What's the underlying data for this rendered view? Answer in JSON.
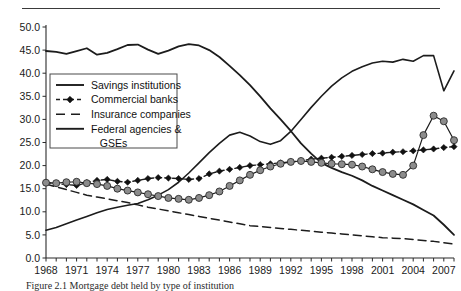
{
  "figure": {
    "caption": "Figure 2.1  Mortgage debt held by type of institution",
    "top_rule": true
  },
  "chart_data": {
    "type": "line",
    "title": "",
    "xlabel": "",
    "ylabel": "",
    "xlim": [
      1968,
      2008
    ],
    "ylim": [
      0.0,
      50.0
    ],
    "ytick_step": 5.0,
    "ytick_labels": [
      "0.0",
      "5.0",
      "10.0",
      "15.0",
      "20.0",
      "25.0",
      "30.0",
      "35.0",
      "40.0",
      "45.0",
      "50.0"
    ],
    "ytick_values": [
      0.0,
      5.0,
      10.0,
      15.0,
      20.0,
      25.0,
      30.0,
      35.0,
      40.0,
      45.0,
      50.0
    ],
    "xtick_labels": [
      "1968",
      "1971",
      "1974",
      "1977",
      "1980",
      "1983",
      "1986",
      "1989",
      "1992",
      "1995",
      "1998",
      "2001",
      "2004",
      "2007"
    ],
    "xtick_values": [
      1968,
      1971,
      1974,
      1977,
      1980,
      1983,
      1986,
      1989,
      1992,
      1995,
      1998,
      2001,
      2004,
      2007
    ],
    "xtick_minor_step": 1,
    "grid": false,
    "legend_position": "upper-left-inside",
    "x": [
      1968,
      1969,
      1970,
      1971,
      1972,
      1973,
      1974,
      1975,
      1976,
      1977,
      1978,
      1979,
      1980,
      1981,
      1982,
      1983,
      1984,
      1985,
      1986,
      1987,
      1988,
      1989,
      1990,
      1991,
      1992,
      1993,
      1994,
      1995,
      1996,
      1997,
      1998,
      1999,
      2000,
      2001,
      2002,
      2003,
      2004,
      2005,
      2006,
      2007,
      2008
    ],
    "series": [
      {
        "name": "Savings institutions",
        "style": "solid",
        "marker": "none",
        "color": "#1c1c1c",
        "width": 1.8,
        "values": [
          44.8,
          44.6,
          44.2,
          44.8,
          45.4,
          44.0,
          44.4,
          45.2,
          46.1,
          46.2,
          45.1,
          44.2,
          44.9,
          45.8,
          46.3,
          46.0,
          45.0,
          43.5,
          41.6,
          39.6,
          37.4,
          35.0,
          32.4,
          30.0,
          27.5,
          24.8,
          22.6,
          20.6,
          19.5,
          18.6,
          17.8,
          16.8,
          15.6,
          14.6,
          13.6,
          12.6,
          11.6,
          10.4,
          9.2,
          7.2,
          5.0
        ]
      },
      {
        "name": "Commercial banks",
        "style": "dash-dot",
        "marker": "diamond",
        "color": "#111111",
        "width": 1.4,
        "values": [
          16.3,
          16.1,
          15.9,
          15.7,
          16.3,
          16.8,
          17.0,
          16.6,
          16.4,
          16.8,
          17.2,
          17.4,
          17.3,
          17.2,
          17.0,
          17.2,
          18.2,
          18.8,
          19.2,
          19.6,
          20.0,
          20.2,
          20.4,
          20.6,
          20.8,
          21.0,
          21.4,
          21.6,
          21.8,
          22.0,
          22.2,
          22.4,
          22.6,
          22.7,
          22.9,
          23.0,
          23.2,
          23.4,
          23.6,
          23.9,
          24.1
        ]
      },
      {
        "name": "Insurance companies",
        "style": "dashed",
        "marker": "none",
        "color": "#1c1c1c",
        "width": 1.5,
        "values": [
          16.0,
          15.4,
          14.8,
          14.2,
          13.6,
          13.2,
          12.8,
          12.4,
          12.0,
          11.5,
          11.0,
          10.6,
          10.2,
          9.8,
          9.4,
          9.0,
          8.6,
          8.2,
          7.8,
          7.4,
          7.0,
          6.8,
          6.6,
          6.4,
          6.2,
          6.0,
          5.8,
          5.6,
          5.4,
          5.2,
          5.0,
          4.8,
          4.6,
          4.4,
          4.3,
          4.2,
          4.0,
          3.8,
          3.6,
          3.3,
          3.0
        ]
      },
      {
        "name": "Federal agencies & GSEs",
        "style": "solid",
        "marker": "none",
        "color": "#1c1c1c",
        "width": 1.6,
        "values": [
          6.0,
          6.6,
          7.4,
          8.2,
          9.0,
          9.8,
          10.5,
          11.0,
          11.4,
          11.8,
          12.6,
          13.6,
          14.8,
          16.4,
          18.4,
          20.6,
          22.8,
          24.8,
          26.6,
          27.2,
          26.4,
          25.2,
          24.6,
          25.4,
          27.4,
          30.0,
          32.6,
          35.0,
          37.2,
          39.0,
          40.4,
          41.4,
          42.2,
          42.6,
          42.4,
          43.0,
          42.6,
          43.8,
          43.8,
          36.2,
          40.5
        ]
      },
      {
        "name": "Other holders",
        "style": "solid",
        "marker": "circle",
        "color": "#1c1c1c",
        "marker_fill": "#8c8c8c",
        "width": 1.2,
        "values": [
          16.3,
          16.2,
          16.4,
          16.5,
          16.2,
          16.0,
          15.6,
          15.0,
          14.6,
          14.2,
          13.8,
          13.4,
          13.0,
          12.8,
          12.6,
          13.0,
          13.6,
          14.4,
          15.6,
          16.8,
          18.0,
          19.0,
          19.8,
          20.4,
          20.8,
          21.0,
          20.8,
          20.6,
          20.4,
          20.3,
          20.2,
          19.8,
          19.2,
          18.6,
          18.2,
          18.0,
          20.0,
          26.6,
          30.8,
          29.6,
          25.5
        ]
      }
    ],
    "legend_entries": [
      {
        "label": "Savings institutions",
        "style": "solid",
        "marker": "none"
      },
      {
        "label": "Commercial banks",
        "style": "dash-dot",
        "marker": "diamond"
      },
      {
        "label": "Insurance companies",
        "style": "dashed",
        "marker": "none"
      },
      {
        "label": "Federal agencies &",
        "style": "solid",
        "marker": "none"
      },
      {
        "label": "GSEs",
        "style": "none",
        "marker": "none"
      }
    ]
  }
}
